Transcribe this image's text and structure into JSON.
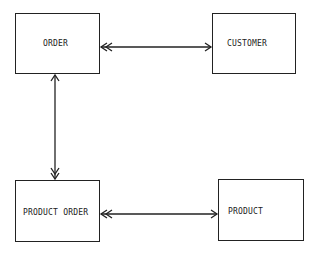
{
  "diagram": {
    "type": "entity-relationship",
    "entities": [
      {
        "id": "order",
        "label": "ORDER"
      },
      {
        "id": "customer",
        "label": "CUSTOMER"
      },
      {
        "id": "product_order",
        "label": "PRODUCT ORDER"
      },
      {
        "id": "product",
        "label": "PRODUCT"
      }
    ],
    "relationships": [
      {
        "from": "order",
        "to": "customer",
        "from_end": "single",
        "to_end": "single",
        "from_arrow": "double-head at ORDER",
        "to_arrow": "single-head at CUSTOMER"
      },
      {
        "from": "order",
        "to": "product_order",
        "from_arrow": "single-head at ORDER",
        "to_arrow": "double-head at PRODUCT ORDER"
      },
      {
        "from": "product_order",
        "to": "product",
        "from_arrow": "double-head at PRODUCT ORDER",
        "to_arrow": "single-head at PRODUCT"
      }
    ]
  },
  "colors": {
    "line": "#222222",
    "background": "#ffffff"
  }
}
